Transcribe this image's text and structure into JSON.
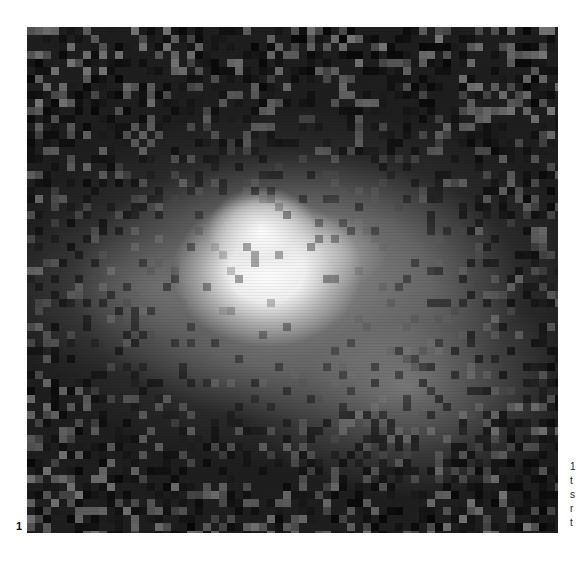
{
  "figure": {
    "number": "1",
    "image_description": "grayscale astronomical image of a diffuse nebula/galaxy with bright central core on dark pixelated background",
    "colors": {
      "background": "#1e1e1e",
      "core": "#ffffff",
      "halo": "#969696",
      "page": "#ffffff"
    }
  },
  "caption_fragments": [
    "1",
    "t",
    "s",
    "r",
    "t"
  ]
}
